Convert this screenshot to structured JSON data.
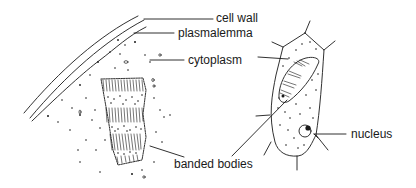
{
  "diagram": {
    "type": "biological illustration",
    "ink_color": "#1a1a1a",
    "background_color": "#ffffff",
    "left_panel": "enlarged section of cell edge",
    "right_panel": "whole cell",
    "labels": {
      "cell_wall": "cell wall",
      "plasmalemma": "plasmalemma",
      "cytoplasm": "cytoplasm",
      "nucleus": "nucleus",
      "banded_bodies": "banded bodies"
    }
  }
}
